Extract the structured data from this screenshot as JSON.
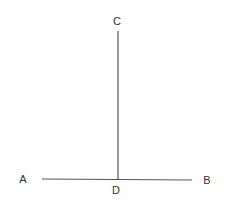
{
  "diagram": {
    "points": [
      {
        "id": "A",
        "label": "A",
        "x": 23,
        "y": 180
      },
      {
        "id": "B",
        "label": "B",
        "x": 207,
        "y": 181
      },
      {
        "id": "C",
        "label": "C",
        "x": 117,
        "y": 22
      },
      {
        "id": "D",
        "label": "D",
        "x": 116,
        "y": 191
      }
    ],
    "segments": [
      {
        "from": "A",
        "to": "B",
        "x1": 42,
        "y1": 179,
        "x2": 192,
        "y2": 180
      },
      {
        "from": "C",
        "to": "D",
        "x1": 118,
        "y1": 31,
        "x2": 118,
        "y2": 179
      }
    ],
    "line_color": "#555555",
    "label_color": "#333333"
  }
}
